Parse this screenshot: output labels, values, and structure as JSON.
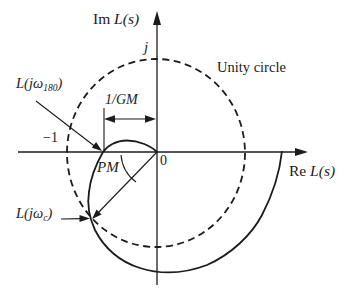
{
  "figure": {
    "colors": {
      "ink": "#1b1b1b",
      "background": "#ffffff"
    },
    "axes": {
      "im_label": {
        "prefix": "Im ",
        "var": "L(s)"
      },
      "re_label": {
        "prefix": "Re ",
        "var": "L(s)"
      },
      "j_tick": "j",
      "origin": "0",
      "minus_one": "−1"
    },
    "annotations": {
      "unity_circle": "Unity circle",
      "gain_margin": "1/GM",
      "phase_margin": "PM",
      "l_omega_180": {
        "main": "L(jω",
        "sub": "180",
        "close": ")"
      },
      "l_omega_c": {
        "main": "L(jω",
        "sub": "c",
        "close": ")"
      }
    }
  }
}
